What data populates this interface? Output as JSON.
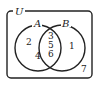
{
  "diagram": {
    "type": "venn",
    "universe_label": "U",
    "sets": [
      {
        "label": "A",
        "only": [
          "2",
          "4"
        ]
      },
      {
        "label": "B",
        "only": [
          "1"
        ]
      }
    ],
    "intersection": [
      "3",
      "5",
      "6"
    ],
    "outside": [
      "7"
    ],
    "colors": {
      "stroke": "#222222",
      "background": "#ffffff"
    }
  }
}
